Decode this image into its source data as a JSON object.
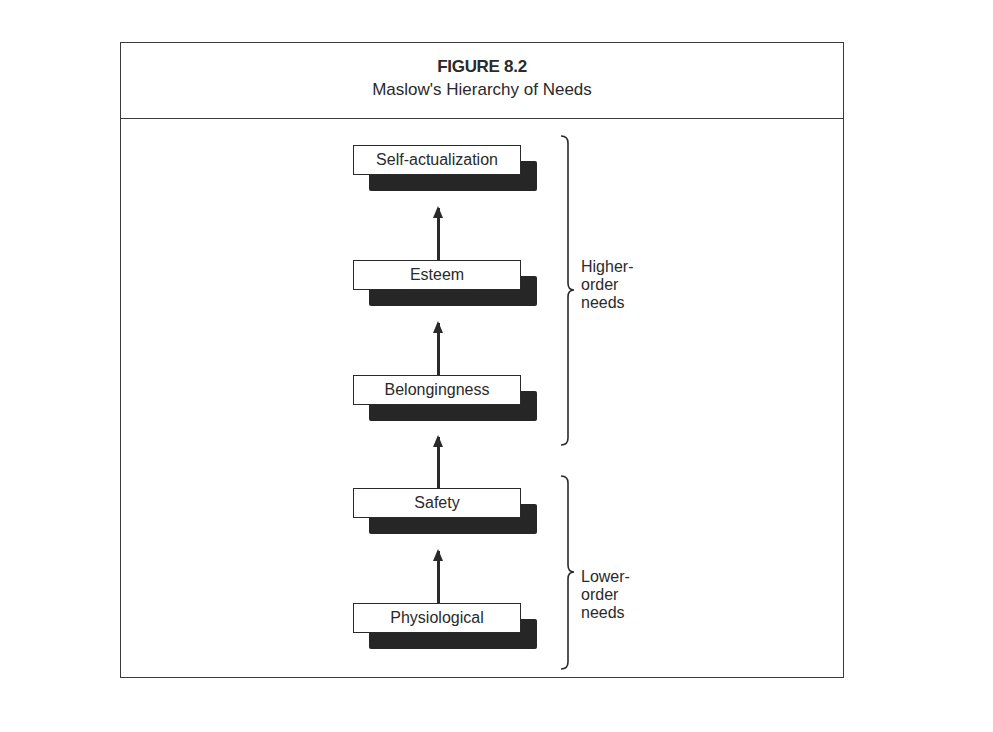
{
  "figure": {
    "number": "FIGURE 8.2",
    "title": "Maslow's Hierarchy of Needs"
  },
  "hierarchy": {
    "levels": [
      {
        "label": "Self-actualization",
        "order": 5
      },
      {
        "label": "Esteem",
        "order": 4
      },
      {
        "label": "Belongingness",
        "order": 3
      },
      {
        "label": "Safety",
        "order": 2
      },
      {
        "label": "Physiological",
        "order": 1
      }
    ],
    "arrows": [
      {
        "from": "Physiological",
        "to": "Safety"
      },
      {
        "from": "Safety",
        "to": "Belongingness"
      },
      {
        "from": "Belongingness",
        "to": "Esteem"
      },
      {
        "from": "Esteem",
        "to": "Self-actualization"
      }
    ],
    "groups": [
      {
        "label_lines": [
          "Higher-",
          "order",
          "needs"
        ],
        "covers": [
          "Self-actualization",
          "Esteem",
          "Belongingness"
        ]
      },
      {
        "label_lines": [
          "Lower-",
          "order",
          "needs"
        ],
        "covers": [
          "Safety",
          "Physiological"
        ]
      }
    ]
  },
  "colors": {
    "ink": "#2a2a2a",
    "shadow": "#262626",
    "background": "#ffffff"
  }
}
